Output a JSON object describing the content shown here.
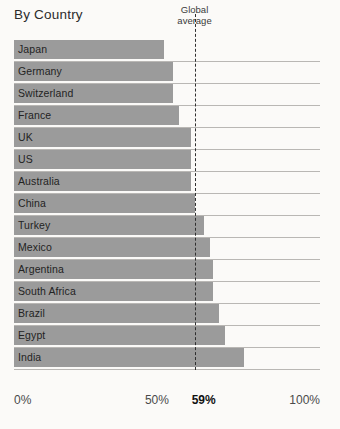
{
  "chart_data": {
    "type": "bar",
    "orientation": "horizontal",
    "title": "By Country",
    "xlabel": "",
    "ylabel": "",
    "xlim": [
      0,
      100
    ],
    "grid": false,
    "legend": null,
    "categories": [
      "Japan",
      "Germany",
      "Switzerland",
      "France",
      "UK",
      "US",
      "Australia",
      "China",
      "Turkey",
      "Mexico",
      "Argentina",
      "South Africa",
      "Brazil",
      "Egypt",
      "India"
    ],
    "values": [
      49,
      52,
      52,
      54,
      58,
      58,
      58,
      59,
      62,
      64,
      65,
      65,
      67,
      69,
      75
    ],
    "tick_labels": [
      "0%",
      "50%",
      "59%",
      "100%"
    ],
    "tick_values": [
      0,
      50,
      59,
      100
    ],
    "annotations": [
      {
        "name": "global-average",
        "label_line1": "Global",
        "label_line2": "average",
        "value": 59,
        "value_label": "59%",
        "style": "dashed-vertical-line"
      }
    ],
    "colors": {
      "bar": "#9b9b9b",
      "background": "#fbfaf8",
      "text": "#2b2b2b",
      "baseline": "#b9b7b4",
      "average_line": "#2f2f2f"
    }
  }
}
